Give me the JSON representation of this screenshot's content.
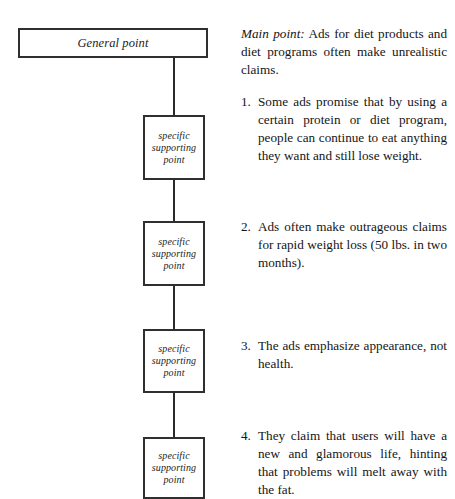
{
  "diagram": {
    "general_node": {
      "label": "General point"
    },
    "supporting_nodes": [
      {
        "label": "specific supporting point"
      },
      {
        "label": "specific supporting point"
      },
      {
        "label": "specific supporting point"
      },
      {
        "label": "specific supporting point"
      }
    ]
  },
  "text_column": {
    "main_point": {
      "lead": "Main point:",
      "body": " Ads for diet products and diet programs often make unrealistic claims."
    },
    "items": [
      {
        "number": "1.",
        "text": "Some ads promise that by using a certain protein or diet program, people can continue to eat anything they want and still lose weight."
      },
      {
        "number": "2.",
        "text": "Ads often make outrageous claims for rapid weight loss (50 lbs. in two months)."
      },
      {
        "number": "3.",
        "text": "The ads emphasize appearance, not health."
      },
      {
        "number": "4.",
        "text": "They claim that users will have a new and glamorous life, hinting that problems will melt away with the fat."
      }
    ]
  },
  "colors": {
    "background": "#ffffff",
    "text": "#151515",
    "box_stroke": "#2f2f2f",
    "connector": "#2a2a2a"
  }
}
